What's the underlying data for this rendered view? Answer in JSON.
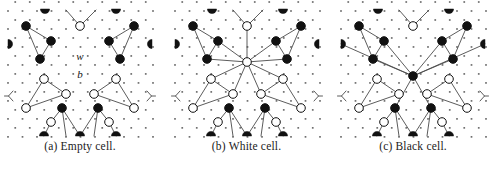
{
  "figure": {
    "name": "lattice-cell-states-figure",
    "background": "#ffffff",
    "ink": "#111111",
    "node_black": "#111111",
    "node_white": "#ffffff",
    "edge_color": "#4a4a4a",
    "dot_color": "#555555",
    "panel_width": 160,
    "panel_height": 140,
    "grid_spacing": 14.5
  },
  "panels": [
    {
      "id": "panel-a",
      "caption_tag": "(a)",
      "caption_text": "Empty cell.",
      "center_node": "none",
      "labels": [
        {
          "text": "w",
          "x": 80,
          "y": 57,
          "style": "italic"
        },
        {
          "text": "b",
          "x": 80,
          "y": 75,
          "style": "italic"
        }
      ],
      "nodes": [
        {
          "x": 26,
          "y": 26,
          "fill": "black"
        },
        {
          "x": 51,
          "y": 41,
          "fill": "black"
        },
        {
          "x": 40,
          "y": 59,
          "fill": "black"
        },
        {
          "x": 109,
          "y": 41,
          "fill": "black"
        },
        {
          "x": 134,
          "y": 26,
          "fill": "black"
        },
        {
          "x": 120,
          "y": 59,
          "fill": "black"
        },
        {
          "x": 80,
          "y": 26,
          "fill": "white"
        },
        {
          "x": 44,
          "y": 79,
          "fill": "white"
        },
        {
          "x": 66,
          "y": 94,
          "fill": "white"
        },
        {
          "x": 116,
          "y": 79,
          "fill": "white"
        },
        {
          "x": 94,
          "y": 94,
          "fill": "white"
        },
        {
          "x": 26,
          "y": 108,
          "fill": "white"
        },
        {
          "x": 134,
          "y": 108,
          "fill": "white"
        },
        {
          "x": 51,
          "y": 122,
          "fill": "white"
        },
        {
          "x": 109,
          "y": 122,
          "fill": "white"
        },
        {
          "x": 62,
          "y": 108,
          "fill": "black"
        },
        {
          "x": 98,
          "y": 108,
          "fill": "black"
        }
      ],
      "edges": [
        [
          26,
          26,
          51,
          41
        ],
        [
          51,
          41,
          40,
          59
        ],
        [
          26,
          26,
          40,
          59
        ],
        [
          134,
          26,
          109,
          41
        ],
        [
          109,
          41,
          120,
          59
        ],
        [
          134,
          26,
          120,
          59
        ],
        [
          80,
          26,
          66,
          10
        ],
        [
          80,
          26,
          96,
          10
        ],
        [
          26,
          108,
          44,
          79
        ],
        [
          44,
          79,
          66,
          94
        ],
        [
          26,
          108,
          66,
          94
        ],
        [
          134,
          108,
          116,
          79
        ],
        [
          116,
          79,
          94,
          94
        ],
        [
          134,
          108,
          94,
          94
        ],
        [
          62,
          108,
          51,
          122
        ],
        [
          51,
          122,
          44,
          136
        ],
        [
          62,
          108,
          66,
          136
        ],
        [
          98,
          108,
          109,
          122
        ],
        [
          109,
          122,
          116,
          136
        ],
        [
          98,
          108,
          94,
          136
        ],
        [
          62,
          108,
          80,
          136
        ],
        [
          98,
          108,
          80,
          136
        ]
      ],
      "half_discs": [
        {
          "x": 45,
          "y": 9,
          "dir": "down"
        },
        {
          "x": 116,
          "y": 9,
          "dir": "down"
        },
        {
          "x": 8,
          "y": 44,
          "dir": "right"
        },
        {
          "x": 152,
          "y": 44,
          "dir": "left"
        },
        {
          "x": 44,
          "y": 136,
          "dir": "up"
        },
        {
          "x": 80,
          "y": 136,
          "dir": "up"
        },
        {
          "x": 116,
          "y": 136,
          "dir": "up"
        }
      ],
      "forks": [
        {
          "x": 8,
          "y": 96,
          "dir": "right"
        },
        {
          "x": 152,
          "y": 96,
          "dir": "left"
        }
      ]
    },
    {
      "id": "panel-b",
      "caption_tag": "(b)",
      "caption_text": "White cell.",
      "center_node": "white",
      "labels": [],
      "nodes": [
        {
          "x": 26,
          "y": 26,
          "fill": "black"
        },
        {
          "x": 51,
          "y": 41,
          "fill": "black"
        },
        {
          "x": 40,
          "y": 59,
          "fill": "black"
        },
        {
          "x": 109,
          "y": 41,
          "fill": "black"
        },
        {
          "x": 134,
          "y": 26,
          "fill": "black"
        },
        {
          "x": 120,
          "y": 59,
          "fill": "black"
        },
        {
          "x": 80,
          "y": 26,
          "fill": "white"
        },
        {
          "x": 80,
          "y": 62,
          "fill": "white"
        },
        {
          "x": 44,
          "y": 79,
          "fill": "white"
        },
        {
          "x": 66,
          "y": 94,
          "fill": "white"
        },
        {
          "x": 116,
          "y": 79,
          "fill": "white"
        },
        {
          "x": 94,
          "y": 94,
          "fill": "white"
        },
        {
          "x": 26,
          "y": 108,
          "fill": "white"
        },
        {
          "x": 134,
          "y": 108,
          "fill": "white"
        },
        {
          "x": 51,
          "y": 122,
          "fill": "white"
        },
        {
          "x": 109,
          "y": 122,
          "fill": "white"
        },
        {
          "x": 62,
          "y": 108,
          "fill": "black"
        },
        {
          "x": 98,
          "y": 108,
          "fill": "black"
        }
      ],
      "edges": [
        [
          26,
          26,
          51,
          41
        ],
        [
          51,
          41,
          40,
          59
        ],
        [
          26,
          26,
          40,
          59
        ],
        [
          134,
          26,
          109,
          41
        ],
        [
          109,
          41,
          120,
          59
        ],
        [
          134,
          26,
          120,
          59
        ],
        [
          80,
          26,
          66,
          10
        ],
        [
          80,
          26,
          96,
          10
        ],
        [
          80,
          62,
          80,
          26
        ],
        [
          80,
          62,
          51,
          41
        ],
        [
          80,
          62,
          109,
          41
        ],
        [
          80,
          62,
          40,
          59
        ],
        [
          80,
          62,
          120,
          59
        ],
        [
          80,
          62,
          44,
          79
        ],
        [
          80,
          62,
          116,
          79
        ],
        [
          80,
          62,
          66,
          94
        ],
        [
          80,
          62,
          94,
          94
        ],
        [
          26,
          108,
          44,
          79
        ],
        [
          44,
          79,
          66,
          94
        ],
        [
          26,
          108,
          66,
          94
        ],
        [
          134,
          108,
          116,
          79
        ],
        [
          116,
          79,
          94,
          94
        ],
        [
          134,
          108,
          94,
          94
        ],
        [
          62,
          108,
          51,
          122
        ],
        [
          51,
          122,
          44,
          136
        ],
        [
          62,
          108,
          66,
          136
        ],
        [
          98,
          108,
          109,
          122
        ],
        [
          109,
          122,
          116,
          136
        ],
        [
          98,
          108,
          94,
          136
        ],
        [
          62,
          108,
          80,
          136
        ],
        [
          98,
          108,
          80,
          136
        ]
      ],
      "half_discs": [
        {
          "x": 45,
          "y": 9,
          "dir": "down"
        },
        {
          "x": 116,
          "y": 9,
          "dir": "down"
        },
        {
          "x": 8,
          "y": 44,
          "dir": "right"
        },
        {
          "x": 152,
          "y": 44,
          "dir": "left"
        },
        {
          "x": 44,
          "y": 136,
          "dir": "up"
        },
        {
          "x": 80,
          "y": 136,
          "dir": "up"
        },
        {
          "x": 116,
          "y": 136,
          "dir": "up"
        }
      ],
      "forks": [
        {
          "x": 8,
          "y": 96,
          "dir": "right"
        },
        {
          "x": 152,
          "y": 96,
          "dir": "left"
        }
      ]
    },
    {
      "id": "panel-c",
      "caption_tag": "(c)",
      "caption_text": "Black cell.",
      "center_node": "black",
      "labels": [],
      "nodes": [
        {
          "x": 26,
          "y": 26,
          "fill": "black"
        },
        {
          "x": 51,
          "y": 41,
          "fill": "black"
        },
        {
          "x": 40,
          "y": 59,
          "fill": "black"
        },
        {
          "x": 109,
          "y": 41,
          "fill": "black"
        },
        {
          "x": 134,
          "y": 26,
          "fill": "black"
        },
        {
          "x": 120,
          "y": 59,
          "fill": "black"
        },
        {
          "x": 80,
          "y": 26,
          "fill": "white"
        },
        {
          "x": 80,
          "y": 76,
          "fill": "black"
        },
        {
          "x": 44,
          "y": 79,
          "fill": "white"
        },
        {
          "x": 66,
          "y": 94,
          "fill": "white"
        },
        {
          "x": 116,
          "y": 79,
          "fill": "white"
        },
        {
          "x": 94,
          "y": 94,
          "fill": "white"
        },
        {
          "x": 26,
          "y": 108,
          "fill": "white"
        },
        {
          "x": 134,
          "y": 108,
          "fill": "white"
        },
        {
          "x": 51,
          "y": 122,
          "fill": "white"
        },
        {
          "x": 109,
          "y": 122,
          "fill": "white"
        },
        {
          "x": 62,
          "y": 108,
          "fill": "black"
        },
        {
          "x": 98,
          "y": 108,
          "fill": "black"
        }
      ],
      "edges": [
        [
          26,
          26,
          51,
          41
        ],
        [
          51,
          41,
          40,
          59
        ],
        [
          26,
          26,
          40,
          59
        ],
        [
          134,
          26,
          109,
          41
        ],
        [
          109,
          41,
          120,
          59
        ],
        [
          134,
          26,
          120,
          59
        ],
        [
          80,
          26,
          66,
          10
        ],
        [
          80,
          26,
          96,
          10
        ],
        [
          80,
          76,
          51,
          41
        ],
        [
          80,
          76,
          109,
          41
        ],
        [
          80,
          76,
          40,
          59
        ],
        [
          80,
          76,
          120,
          59
        ],
        [
          80,
          76,
          8,
          44
        ],
        [
          80,
          76,
          152,
          44
        ],
        [
          80,
          76,
          62,
          108
        ],
        [
          80,
          76,
          98,
          108
        ],
        [
          26,
          108,
          44,
          79
        ],
        [
          44,
          79,
          66,
          94
        ],
        [
          26,
          108,
          66,
          94
        ],
        [
          134,
          108,
          116,
          79
        ],
        [
          116,
          79,
          94,
          94
        ],
        [
          134,
          108,
          94,
          94
        ],
        [
          62,
          108,
          51,
          122
        ],
        [
          51,
          122,
          44,
          136
        ],
        [
          62,
          108,
          66,
          136
        ],
        [
          98,
          108,
          109,
          122
        ],
        [
          109,
          122,
          116,
          136
        ],
        [
          98,
          108,
          94,
          136
        ],
        [
          62,
          108,
          80,
          136
        ],
        [
          98,
          108,
          80,
          136
        ]
      ],
      "half_discs": [
        {
          "x": 45,
          "y": 9,
          "dir": "down"
        },
        {
          "x": 116,
          "y": 9,
          "dir": "down"
        },
        {
          "x": 8,
          "y": 44,
          "dir": "right"
        },
        {
          "x": 152,
          "y": 44,
          "dir": "left"
        },
        {
          "x": 44,
          "y": 136,
          "dir": "up"
        },
        {
          "x": 80,
          "y": 136,
          "dir": "up"
        },
        {
          "x": 116,
          "y": 136,
          "dir": "up"
        }
      ],
      "forks": [
        {
          "x": 8,
          "y": 96,
          "dir": "right"
        },
        {
          "x": 152,
          "y": 96,
          "dir": "left"
        }
      ]
    }
  ]
}
